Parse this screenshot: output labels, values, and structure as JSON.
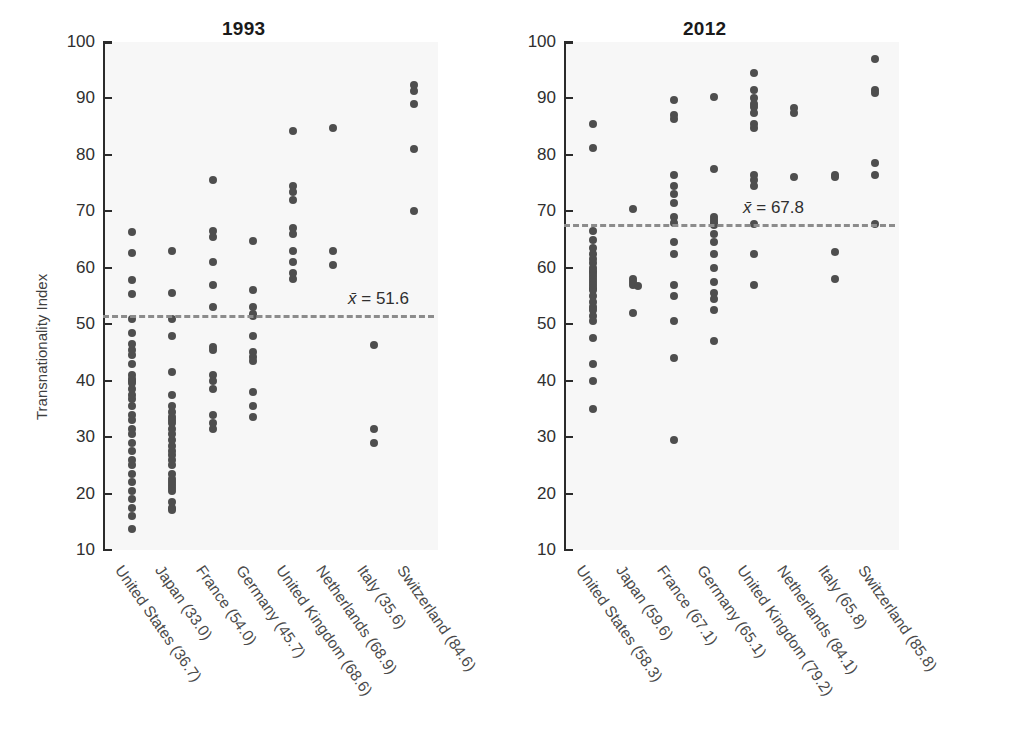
{
  "figure": {
    "ylabel": "Transnationality Index",
    "ytick_labels": [
      "100",
      "90",
      "80",
      "70",
      "60",
      "50",
      "40",
      "30",
      "20",
      "10"
    ]
  },
  "panels": {
    "left": {
      "title": "1993",
      "mean_label": "= 51.6",
      "mean_symbol": "x̄"
    },
    "right": {
      "title": "2012",
      "mean_label": "= 67.8",
      "mean_symbol": "x̄"
    }
  },
  "chart_data": [
    {
      "type": "scatter",
      "title": "1993",
      "xlabel": "",
      "ylabel": "Transnationality Index",
      "ylim": [
        10,
        100
      ],
      "yticks": [
        10,
        20,
        30,
        40,
        50,
        60,
        70,
        80,
        90,
        100
      ],
      "grid": false,
      "legend": "none",
      "annotations": [
        {
          "text": "x̄ = 51.6",
          "type": "mean-line",
          "value": 51.6
        }
      ],
      "categories": [
        "United States (36.7)",
        "Japan (33.0)",
        "France (54.0)",
        "Germany (45.7)",
        "United Kingdom (68.6)",
        "Netherlands (68.9)",
        "Italy (35.6)",
        "Switzerland (84.6)"
      ],
      "category_means": [
        36.7,
        33.0,
        54.0,
        45.7,
        68.6,
        68.9,
        35.6,
        84.6
      ],
      "series": [
        {
          "name": "United States (36.7)",
          "values": [
            66.3,
            62.7,
            57.8,
            55.3,
            51.0,
            48.5,
            46.5,
            45.5,
            44.5,
            43.0,
            41.0,
            40.3,
            40.0,
            39.5,
            38.5,
            37.5,
            36.8,
            35.5,
            34.0,
            33.0,
            31.5,
            30.5,
            29.0,
            27.5,
            26.0,
            25.0,
            23.5,
            22.0,
            20.5,
            19.0,
            17.5,
            16.0,
            13.8
          ]
        },
        {
          "name": "Japan (33.0)",
          "values": [
            63.0,
            55.5,
            51.0,
            48.0,
            41.5,
            37.5,
            35.5,
            34.5,
            33.5,
            33.0,
            32.5,
            31.5,
            30.5,
            29.5,
            28.5,
            27.5,
            26.8,
            26.0,
            25.0,
            23.5,
            22.5,
            22.0,
            21.5,
            21.0,
            20.5,
            18.5,
            17.5,
            17.0
          ]
        },
        {
          "name": "France (54.0)",
          "values": [
            75.5,
            66.5,
            65.5,
            61.0,
            57.0,
            53.0,
            46.0,
            45.5,
            41.0,
            40.0,
            38.5,
            34.0,
            32.5,
            31.5
          ]
        },
        {
          "name": "Germany (45.7)",
          "values": [
            64.8,
            56.0,
            53.0,
            51.8,
            51.5,
            48.0,
            45.0,
            44.2,
            43.5,
            38.0,
            35.5,
            33.5
          ]
        },
        {
          "name": "United Kingdom (68.6)",
          "values": [
            84.3,
            74.5,
            73.5,
            72.0,
            67.0,
            66.0,
            63.0,
            61.0,
            59.0,
            58.0
          ]
        },
        {
          "name": "Netherlands (68.9)",
          "values": [
            84.8,
            63.0,
            60.5
          ]
        },
        {
          "name": "Italy (35.6)",
          "values": [
            46.3,
            31.5,
            29.0
          ]
        },
        {
          "name": "Switzerland (84.6)",
          "values": [
            92.3,
            91.3,
            89.0,
            81.0,
            70.0
          ]
        }
      ]
    },
    {
      "type": "scatter",
      "title": "2012",
      "xlabel": "",
      "ylabel": "Transnationality Index",
      "ylim": [
        10,
        100
      ],
      "yticks": [
        10,
        20,
        30,
        40,
        50,
        60,
        70,
        80,
        90,
        100
      ],
      "grid": false,
      "legend": "none",
      "annotations": [
        {
          "text": "x̄ = 67.8",
          "type": "mean-line",
          "value": 67.8
        }
      ],
      "categories": [
        "United States (58.3)",
        "Japan (59.6)",
        "France (67.1)",
        "Germany (65.1)",
        "United Kingdom (79.2)",
        "Netherlands (84.1)",
        "Italy (65.8)",
        "Switzerland (85.8)"
      ],
      "category_means": [
        58.3,
        59.6,
        67.1,
        65.1,
        79.2,
        84.1,
        65.8,
        85.8
      ],
      "series": [
        {
          "name": "United States (58.3)",
          "values": [
            85.5,
            81.3,
            66.5,
            65.0,
            63.5,
            62.5,
            61.5,
            60.8,
            60.0,
            59.5,
            59.0,
            58.5,
            58.0,
            57.5,
            57.0,
            56.5,
            56.0,
            55.0,
            54.0,
            53.0,
            52.5,
            51.5,
            50.5,
            47.5,
            43.0,
            40.0,
            35.0
          ]
        },
        {
          "name": "Japan (59.6)",
          "values": [
            70.5,
            58.0,
            57.5,
            57.0,
            56.8,
            52.0
          ]
        },
        {
          "name": "France (67.1)",
          "values": [
            89.8,
            87.0,
            86.3,
            76.5,
            74.5,
            73.0,
            71.5,
            69.0,
            68.0,
            64.5,
            62.5,
            57.0,
            55.0,
            50.5,
            44.0,
            29.5
          ]
        },
        {
          "name": "Germany (65.1)",
          "values": [
            90.3,
            77.5,
            69.0,
            68.5,
            68.0,
            67.5,
            66.0,
            64.5,
            62.5,
            60.0,
            57.5,
            55.5,
            54.5,
            52.5,
            47.0
          ]
        },
        {
          "name": "United Kingdom (79.2)",
          "values": [
            94.5,
            91.5,
            90.0,
            89.0,
            88.5,
            87.5,
            85.5,
            84.8,
            76.5,
            75.5,
            74.5,
            67.8,
            62.5,
            57.0
          ]
        },
        {
          "name": "Netherlands (84.1)",
          "values": [
            88.3,
            87.5,
            76.0
          ]
        },
        {
          "name": "Italy (65.8)",
          "values": [
            76.5,
            76.0,
            62.8,
            58.0
          ]
        },
        {
          "name": "Switzerland (85.8)",
          "values": [
            97.0,
            91.5,
            91.0,
            78.5,
            76.5,
            67.8
          ]
        }
      ]
    }
  ]
}
